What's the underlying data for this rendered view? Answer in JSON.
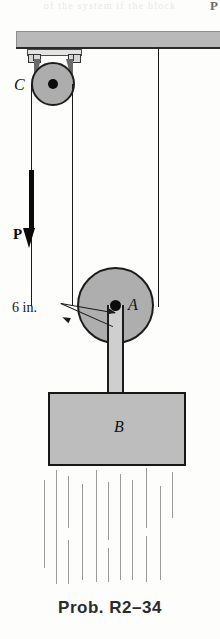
{
  "figure": {
    "caption": "Prob. R2–34",
    "top_remnant": "of the system if the block",
    "top_remnant_right": "P",
    "labels": {
      "pulley_c": "C",
      "pulley_a": "A",
      "block_b": "B",
      "force_p": "P",
      "radius_dim": "6 in."
    },
    "colors": {
      "body_fill": "#bdbdbd",
      "pulley_fill": "#aeaeae",
      "beam_fill": "#b9b9b9",
      "outline": "#1a1a1a",
      "hatch": "#9a9a9a",
      "caption": "#2b2b2b",
      "page": "#fdfdfc"
    },
    "hatch_lines": [
      {
        "x": 44,
        "y": 12,
        "h": 88
      },
      {
        "x": 56,
        "y": 2,
        "h": 114
      },
      {
        "x": 68,
        "y": 8,
        "h": 52
      },
      {
        "x": 68,
        "y": 72,
        "h": 44
      },
      {
        "x": 82,
        "y": 16,
        "h": 96
      },
      {
        "x": 96,
        "y": 2,
        "h": 112
      },
      {
        "x": 108,
        "y": 14,
        "h": 58
      },
      {
        "x": 108,
        "y": 80,
        "h": 34
      },
      {
        "x": 120,
        "y": 6,
        "h": 106
      },
      {
        "x": 132,
        "y": 12,
        "h": 100
      },
      {
        "x": 146,
        "y": 0,
        "h": 60
      },
      {
        "x": 146,
        "y": 68,
        "h": 46
      },
      {
        "x": 160,
        "y": 18,
        "h": 94
      },
      {
        "x": 172,
        "y": 4,
        "h": 46
      }
    ]
  }
}
